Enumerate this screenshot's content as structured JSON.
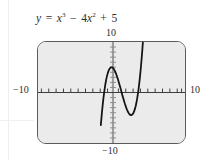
{
  "caption": {
    "lhs": "y",
    "equals": "=",
    "term1_base": "x",
    "term1_exp": "3",
    "minus": "−",
    "term2_coef": "4",
    "term2_base": "x",
    "term2_exp": "2",
    "plus": "+",
    "term3": "5",
    "full_text": "y = x³ − 4x² + 5"
  },
  "axis_labels": {
    "top": "10",
    "left": "−10",
    "right": "10",
    "bottom": "−10"
  },
  "window": {
    "xmin": -10,
    "xmax": 10,
    "ymin": -10,
    "ymax": 10,
    "xscl": 1,
    "yscl": 1
  },
  "colors": {
    "plot_background": "#ebebeb",
    "frame_border": "#5a5a5a",
    "x_axis": "#3a3a3a",
    "y_axis": "#9a9a9a",
    "curve": "#1a1a1a",
    "page_background": "#ffffff",
    "text": "#2e2e2e"
  },
  "chart_data": {
    "type": "line",
    "xlabel": "",
    "ylabel": "",
    "xlim": [
      -10,
      10
    ],
    "ylim": [
      -10,
      10
    ],
    "grid": false,
    "legend": "none",
    "expression": "y = x^3 - 4*x^2 + 5",
    "x_tick_interval": 1,
    "y_tick_interval": 1,
    "annotations": [
      {
        "label": "local maximum",
        "x": 0,
        "y": 5
      },
      {
        "label": "local minimum",
        "x": 2.667,
        "y": -4.48
      }
    ],
    "series": [
      {
        "name": "y = x^3 - 4x^2 + 5",
        "x": [
          -1.45,
          -1.4,
          -1.3,
          -1.2,
          -1.1,
          -1.0,
          -0.9,
          -0.8,
          -0.7,
          -0.6,
          -0.5,
          -0.4,
          -0.3,
          -0.2,
          -0.1,
          0.0,
          0.1,
          0.2,
          0.3,
          0.4,
          0.5,
          0.6,
          0.7,
          0.8,
          0.9,
          1.0,
          1.1,
          1.2,
          1.3,
          1.4,
          1.5,
          1.6,
          1.7,
          1.8,
          1.9,
          2.0,
          2.1,
          2.2,
          2.3,
          2.4,
          2.5,
          2.6,
          2.67,
          2.7,
          2.8,
          2.9,
          3.0,
          3.1,
          3.2,
          3.3,
          3.4,
          3.5,
          3.6,
          3.7,
          3.8,
          3.9,
          4.0,
          4.1,
          4.2,
          4.3,
          4.4,
          4.5,
          4.6
        ],
        "y": [
          -6.45,
          -5.58,
          -3.96,
          -2.49,
          -1.17,
          0.0,
          1.03,
          1.93,
          2.7,
          3.34,
          3.88,
          4.3,
          4.61,
          4.83,
          4.96,
          5.0,
          4.96,
          4.85,
          4.67,
          4.42,
          4.13,
          3.78,
          3.38,
          2.95,
          2.49,
          2.0,
          1.49,
          0.97,
          0.44,
          -0.1,
          -0.63,
          -1.14,
          -1.64,
          -2.13,
          -2.58,
          -3.0,
          -3.38,
          -3.71,
          -3.99,
          -4.22,
          -4.38,
          -4.46,
          -4.48,
          -4.48,
          -4.41,
          -4.25,
          -4.0,
          -3.65,
          -3.19,
          -2.62,
          -1.94,
          -1.13,
          -0.18,
          0.89,
          2.11,
          3.49,
          5.0,
          6.69,
          8.53,
          10.57,
          12.78,
          15.13,
          17.7
        ]
      }
    ]
  }
}
